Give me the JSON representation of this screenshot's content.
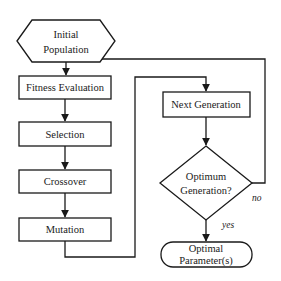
{
  "diagram": {
    "type": "flowchart",
    "nodes": {
      "initial_population": {
        "shape": "hexagon",
        "line1": "Initial",
        "line2": "Population"
      },
      "fitness_evaluation": {
        "shape": "rectangle",
        "label": "Fitness Evaluation"
      },
      "selection": {
        "shape": "rectangle",
        "label": "Selection"
      },
      "crossover": {
        "shape": "rectangle",
        "label": "Crossover"
      },
      "mutation": {
        "shape": "rectangle",
        "label": "Mutation"
      },
      "next_generation": {
        "shape": "rectangle",
        "label": "Next Generation"
      },
      "optimum_generation": {
        "shape": "diamond",
        "line1": "Optimum",
        "line2": "Generation?"
      },
      "optimal_parameters": {
        "shape": "terminator",
        "line1": "Optimal",
        "line2": "Parameter(s)"
      }
    },
    "edges": [
      {
        "from": "initial_population",
        "to": "fitness_evaluation",
        "label": ""
      },
      {
        "from": "fitness_evaluation",
        "to": "selection",
        "label": ""
      },
      {
        "from": "selection",
        "to": "crossover",
        "label": ""
      },
      {
        "from": "crossover",
        "to": "mutation",
        "label": ""
      },
      {
        "from": "mutation",
        "to": "next_generation",
        "label": ""
      },
      {
        "from": "next_generation",
        "to": "optimum_generation",
        "label": ""
      },
      {
        "from": "optimum_generation",
        "to": "fitness_evaluation",
        "label": "no"
      },
      {
        "from": "optimum_generation",
        "to": "optimal_parameters",
        "label": "yes"
      }
    ],
    "edge_labels": {
      "no": "no",
      "yes": "yes"
    },
    "colors": {
      "stroke": "#1a1a1a",
      "fill": "#ffffff",
      "background": "#ffffff"
    }
  }
}
